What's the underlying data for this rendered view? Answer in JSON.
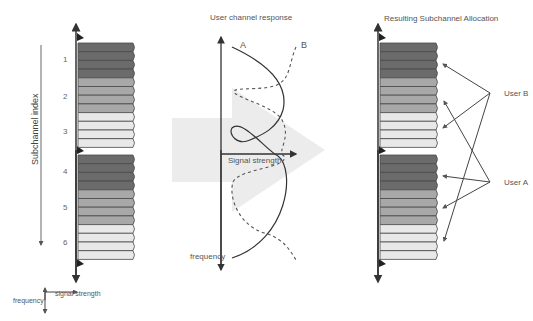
{
  "diagram": {
    "left_panel": {
      "axis_label": "Subchannel index",
      "subchannel_numbers": [
        "1",
        "2",
        "3",
        "4",
        "5",
        "6"
      ],
      "legend": {
        "frequency": "frequency",
        "signal_strength": "signal strength"
      }
    },
    "middle_panel": {
      "title": "User channel response",
      "curve_a_label": "A",
      "curve_b_label": "B",
      "x_axis_label": "Signal strength",
      "y_axis_label": "frequency"
    },
    "right_panel": {
      "title": "Resulting Subchannel Allocation",
      "user_b_label": "User B",
      "user_a_label": "User A"
    },
    "colors": {
      "dark": "#6b6b6b",
      "medium": "#a8a8a8",
      "light": "#e8e8e8",
      "outline": "#4a4a4a",
      "big_arrow": "#ececec"
    }
  }
}
